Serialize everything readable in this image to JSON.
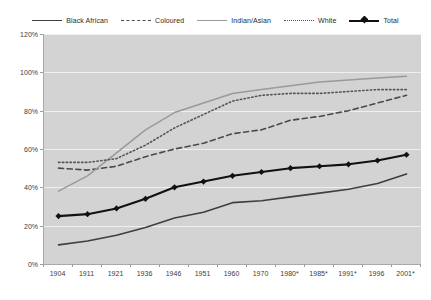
{
  "chart_data": {
    "type": "line",
    "title": "",
    "xlabel": "",
    "ylabel": "",
    "ylim": [
      0,
      120
    ],
    "ytick_labels": [
      "0%",
      "20%",
      "40%",
      "60%",
      "80%",
      "100%",
      "120%"
    ],
    "ytick_values": [
      0,
      20,
      40,
      60,
      80,
      100,
      120
    ],
    "grid": true,
    "legend_position": "top",
    "plot_background": "#d3d3d3",
    "categories": [
      "1904",
      "1911",
      "1921",
      "1936",
      "1946",
      "1951",
      "1960",
      "1970",
      "1980*",
      "1985*",
      "1991*",
      "1996",
      "2001*"
    ],
    "series": [
      {
        "name": "Black African",
        "style": "solid",
        "color": "#3f3f3f",
        "marker": "none",
        "values": [
          10,
          12,
          15,
          19,
          24,
          27,
          32,
          33,
          35,
          37,
          39,
          42,
          47
        ]
      },
      {
        "name": "Coloured",
        "style": "dashed",
        "color": "#4a4a4a",
        "marker": "none",
        "values": [
          50,
          49,
          51,
          56,
          60,
          63,
          68,
          70,
          75,
          77,
          80,
          84,
          88
        ]
      },
      {
        "name": "Indian/Asian",
        "style": "solid",
        "color": "#9a9a9a",
        "marker": "none",
        "values": [
          38,
          46,
          58,
          70,
          79,
          84,
          89,
          91,
          93,
          95,
          96,
          97,
          98
        ]
      },
      {
        "name": "White",
        "style": "dotted",
        "color": "#555555",
        "marker": "none",
        "values": [
          53,
          53,
          55,
          62,
          71,
          78,
          85,
          88,
          89,
          89,
          90,
          91,
          91
        ]
      },
      {
        "name": "Total",
        "style": "solid",
        "color": "#111111",
        "marker": "diamond",
        "values": [
          25,
          26,
          29,
          34,
          40,
          43,
          46,
          48,
          50,
          51,
          52,
          54,
          57
        ]
      }
    ]
  },
  "legend": {
    "items": [
      {
        "label": "Black African",
        "key": "k-solid-dark"
      },
      {
        "label": "Coloured",
        "key": "k-dashed"
      },
      {
        "label": "Indian/Asian",
        "key": "k-solid-gray"
      },
      {
        "label": "White",
        "key": "k-dotted"
      },
      {
        "label": "Total",
        "key": "k-total"
      }
    ]
  }
}
